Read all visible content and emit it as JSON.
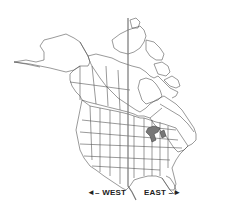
{
  "map": {
    "title": "",
    "region": "North America",
    "labels": {
      "west": "◄– WEST",
      "east": "EAST –►"
    },
    "divider": {
      "description": "vertical line dividing west and east",
      "color": "#777777"
    },
    "colors": {
      "land_fill": "#ffffff",
      "outline": "#555555",
      "background": "#ffffff"
    }
  }
}
